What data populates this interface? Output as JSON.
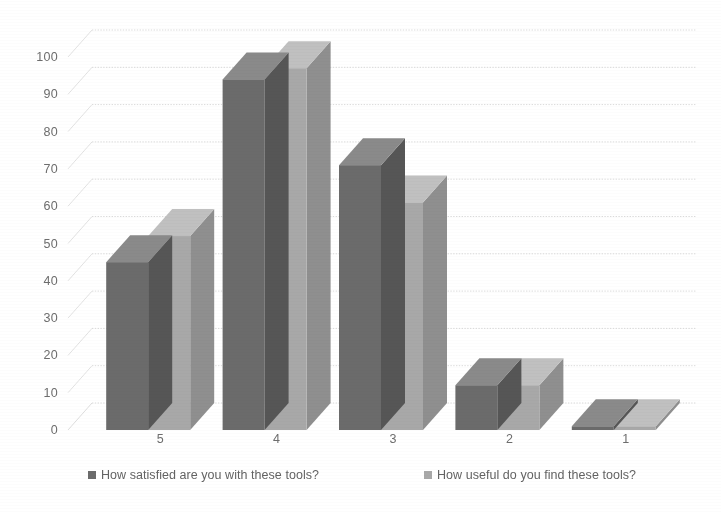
{
  "chart_data": {
    "type": "bar",
    "title": "",
    "subtitle": "",
    "xlabel": "",
    "ylabel": "",
    "categories": [
      "5",
      "4",
      "3",
      "2",
      "1"
    ],
    "ylim": [
      0,
      100
    ],
    "y_ticks": [
      "0",
      "10",
      "20",
      "30",
      "40",
      "50",
      "60",
      "70",
      "80",
      "90",
      "100"
    ],
    "grid": true,
    "legend_position": "bottom",
    "three_d": true,
    "series": [
      {
        "name": "How satisfied are you with these tools?",
        "color": "#6b6b6b",
        "values": [
          45,
          94,
          71,
          12,
          1
        ]
      },
      {
        "name": "How useful do you find these tools?",
        "color": "#a8a8a8",
        "values": [
          52,
          97,
          61,
          12,
          1
        ]
      }
    ]
  },
  "legend": {
    "entries": [
      {
        "label": "How satisfied are you with these tools?",
        "marker": "square-swatch-dark"
      },
      {
        "label": "How useful do you find these tools?",
        "marker": "square-swatch-light"
      }
    ]
  },
  "colors": {
    "series_dark_front": "#6b6b6b",
    "series_dark_top": "#8a8a8a",
    "series_dark_side": "#565656",
    "series_light_front": "#a8a8a8",
    "series_light_top": "#c0c0c0",
    "series_light_side": "#8f8f8f",
    "gridline": "#d9d9d9",
    "axis_text": "#6d6d6d",
    "background": "#ffffff"
  }
}
